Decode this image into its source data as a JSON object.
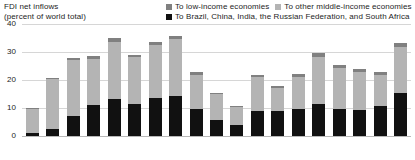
{
  "title": {
    "line1": "FDI net inflows",
    "line2": "(percent of world total)"
  },
  "legend": {
    "items": [
      {
        "label": "To low-income economies",
        "color": "#808080",
        "icon": "legend-swatch-low-income"
      },
      {
        "label": "To other middle-income economies",
        "color": "#b4b4b4",
        "icon": "legend-swatch-other-middle-income"
      },
      {
        "label": "To Brazil, China, India, the Russian Federation, and South Africa",
        "color": "#111111",
        "icon": "legend-swatch-brics"
      }
    ]
  },
  "axis": {
    "y_ticks": [
      "0",
      "10",
      "20",
      "30",
      "40"
    ]
  },
  "chart_data": {
    "type": "bar",
    "title": "FDI net inflows (percent of world total)",
    "xlabel": "",
    "ylabel": "percent of world total",
    "ylim": [
      0,
      40
    ],
    "yticks": [
      0,
      10,
      20,
      30,
      40
    ],
    "grid": true,
    "stacked": true,
    "legend_position": "top-right",
    "categories": [
      "1990",
      "1991",
      "1992",
      "1993",
      "1994",
      "1995",
      "1996",
      "1997",
      "1998",
      "1999",
      "2000",
      "2001",
      "2002",
      "2003",
      "2004",
      "2005",
      "2006",
      "2007",
      "2008"
    ],
    "series": [
      {
        "name": "To Brazil, China, India, the Russian Federation, and South Africa",
        "color": "#111111",
        "values": [
          1.0,
          2.4,
          7.2,
          11.0,
          13.2,
          11.5,
          13.7,
          14.3,
          9.6,
          5.6,
          3.9,
          9.0,
          9.1,
          9.6,
          11.6,
          9.7,
          9.3,
          10.6,
          15.5
        ]
      },
      {
        "name": "To other middle-income economies",
        "color": "#b4b4b4",
        "values": [
          8.5,
          18.0,
          19.9,
          16.5,
          20.4,
          16.7,
          18.8,
          20.4,
          12.3,
          9.3,
          6.6,
          12.2,
          8.0,
          11.4,
          16.6,
          14.7,
          13.7,
          11.2,
          16.2
        ]
      },
      {
        "name": "To low-income economies",
        "color": "#808080",
        "values": [
          0.4,
          0.5,
          0.9,
          1.0,
          1.4,
          0.7,
          1.2,
          1.2,
          0.8,
          0.5,
          0.4,
          0.7,
          0.8,
          1.0,
          1.3,
          1.0,
          1.0,
          1.0,
          1.6
        ]
      }
    ],
    "totals": [
      9.9,
      20.9,
      28.0,
      28.5,
      35.0,
      28.9,
      33.7,
      35.9,
      22.7,
      15.4,
      10.9,
      21.9,
      17.9,
      22.0,
      29.5,
      25.4,
      24.0,
      22.8,
      33.3
    ]
  }
}
